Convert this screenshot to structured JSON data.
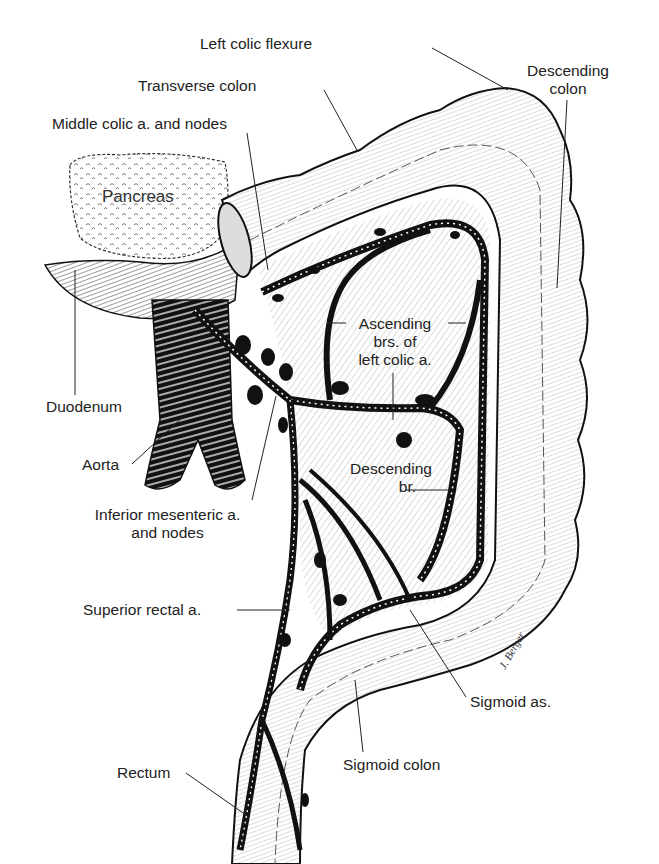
{
  "figure": {
    "style": "black-and-white pen-and-ink anatomical illustration",
    "colors": {
      "ink": "#111111",
      "background": "#ffffff",
      "label_text": "#222222"
    },
    "artist_signature": "J. Berger"
  },
  "labels": {
    "left_colic_flexure": "Left colic flexure",
    "descending_colon_1": "Descending",
    "descending_colon_2": "colon",
    "transverse_colon": "Transverse colon",
    "middle_colic": "Middle colic a. and nodes",
    "pancreas": "Pancreas",
    "ascending_brs_1": "Ascending",
    "ascending_brs_2": "brs. of",
    "ascending_brs_3": "left colic a.",
    "duodenum": "Duodenum",
    "aorta": "Aorta",
    "descending_br_1": "Descending",
    "descending_br_2": "br.",
    "inferior_mesenteric_1": "Inferior mesenteric a.",
    "inferior_mesenteric_2": "and nodes",
    "superior_rectal": "Superior rectal a.",
    "sigmoid_as": "Sigmoid as.",
    "sigmoid_colon": "Sigmoid colon",
    "rectum": "Rectum"
  }
}
